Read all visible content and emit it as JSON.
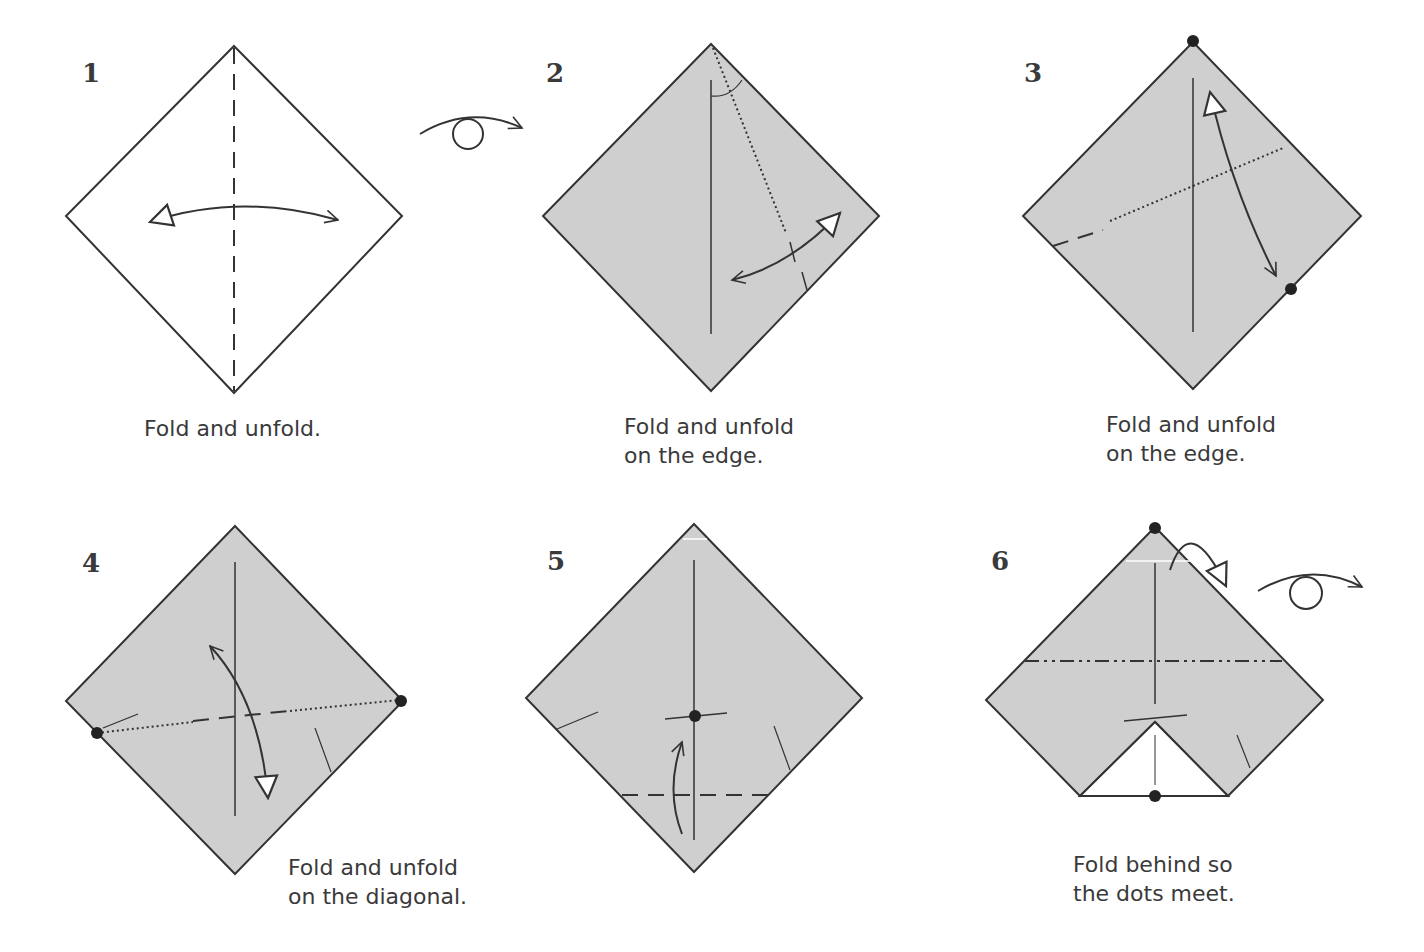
{
  "diagram": {
    "colors": {
      "paper_colored": "#cfcfcf",
      "paper_white": "#ffffff",
      "line": "#333333",
      "text": "#3a3a3a"
    },
    "turn_over_symbols": 2,
    "steps": [
      {
        "number": "1",
        "caption": "Fold and unfold."
      },
      {
        "number": "2",
        "caption": "Fold and unfold\non the edge."
      },
      {
        "number": "3",
        "caption": "Fold and unfold\non the edge."
      },
      {
        "number": "4",
        "caption": "Fold and unfold\non the diagonal."
      },
      {
        "number": "5",
        "caption": ""
      },
      {
        "number": "6",
        "caption": "Fold behind so\nthe dots meet."
      }
    ]
  }
}
